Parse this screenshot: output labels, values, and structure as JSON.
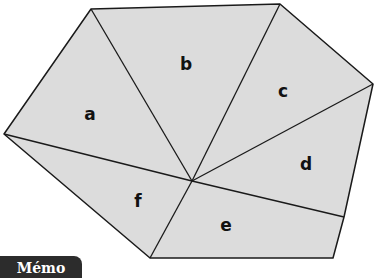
{
  "figure": {
    "fill_color": "#dcdcdc",
    "stroke_color": "#1a1a1a",
    "center": [
      192,
      181
    ],
    "outer_vertices": [
      [
        91,
        9
      ],
      [
        280,
        4
      ],
      [
        373,
        84
      ],
      [
        344,
        217
      ],
      [
        333,
        258
      ],
      [
        150,
        258
      ],
      [
        4,
        134
      ]
    ],
    "regions": [
      {
        "label": "a",
        "pos": [
          90,
          120
        ]
      },
      {
        "label": "b",
        "pos": [
          186,
          70
        ]
      },
      {
        "label": "c",
        "pos": [
          283,
          97
        ]
      },
      {
        "label": "d",
        "pos": [
          306,
          170
        ]
      },
      {
        "label": "e",
        "pos": [
          226,
          227
        ]
      },
      {
        "label": "f",
        "pos": [
          138,
          205
        ]
      }
    ]
  },
  "badge": {
    "label": "Mémo"
  }
}
